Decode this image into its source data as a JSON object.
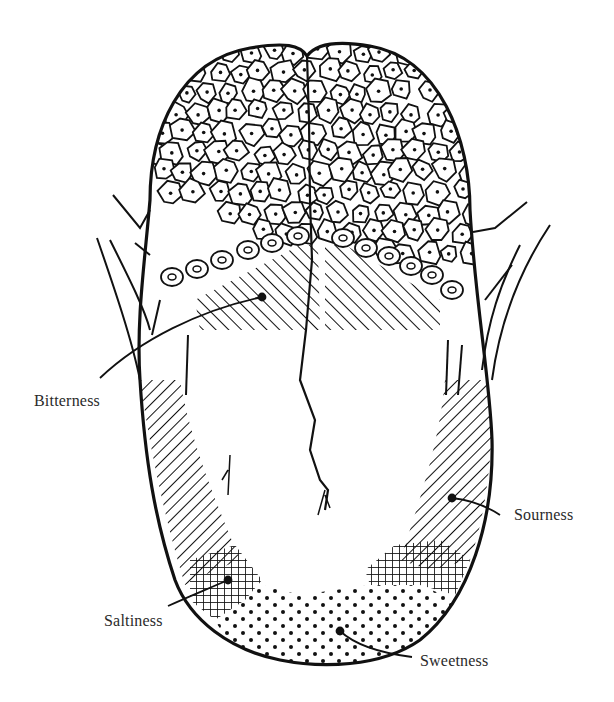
{
  "diagram": {
    "colors": {
      "ink": "#111111",
      "background": "#ffffff",
      "label_text": "#2a2a2a"
    },
    "regions": [
      {
        "id": "bitterness",
        "label": "Bitterness",
        "pattern": "diagonal-hatch",
        "location": "back of tongue"
      },
      {
        "id": "sourness",
        "label": "Sourness",
        "pattern": "diagonal-hatch",
        "location": "sides of tongue"
      },
      {
        "id": "saltiness",
        "label": "Saltiness",
        "pattern": "cross-hatch",
        "location": "front sides"
      },
      {
        "id": "sweetness",
        "label": "Sweetness",
        "pattern": "stipple-dots",
        "location": "tip of tongue"
      }
    ],
    "labels": {
      "bitterness": "Bitterness",
      "sourness": "Sourness",
      "saltiness": "Saltiness",
      "sweetness": "Sweetness"
    }
  }
}
